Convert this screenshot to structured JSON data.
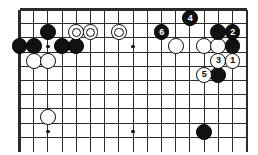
{
  "figure": {
    "kind": "go-board-diagram",
    "board_size": 19,
    "width_px": 258,
    "height_px": 155,
    "background_color": "#ffffff",
    "line_color": "#2b2b2b",
    "black_color": "#111111",
    "white_color": "#ffffff",
    "stone_outline_color": "#0d0d0d"
  },
  "grid": {
    "origin_x": 19.5,
    "origin_y": 9.5,
    "cell": 14.2,
    "cols_visible": 17,
    "rows_visible": 10,
    "edge_top": true,
    "edge_left": true,
    "edge_right": true,
    "edge_bottom": false,
    "border_thickness": 2.2,
    "line_thickness": 1.1
  },
  "star_points": [
    {
      "col": 2,
      "row": 8.6,
      "name": "star-point-left"
    },
    {
      "col": 8,
      "row": 8.6,
      "name": "star-point-center"
    },
    {
      "col": 2,
      "row": 2.6,
      "name": "star-point-upper-left"
    },
    {
      "col": 8,
      "row": 2.6,
      "name": "star-point-upper-center"
    }
  ],
  "stones": [
    {
      "id": "b-a",
      "color": "black",
      "col": 0,
      "row": 2.6,
      "label": "",
      "mark": ""
    },
    {
      "id": "b-b",
      "color": "black",
      "col": 1,
      "row": 2.6,
      "label": "",
      "mark": ""
    },
    {
      "id": "b-c",
      "color": "black",
      "col": 2,
      "row": 1.6,
      "label": "",
      "mark": ""
    },
    {
      "id": "b-d",
      "color": "black",
      "col": 3,
      "row": 2.6,
      "label": "",
      "mark": ""
    },
    {
      "id": "b-e",
      "color": "black",
      "col": 4,
      "row": 2.6,
      "label": "",
      "mark": ""
    },
    {
      "id": "w-a",
      "color": "white",
      "col": 1,
      "row": 3.6,
      "label": "",
      "mark": ""
    },
    {
      "id": "w-b",
      "color": "white",
      "col": 2,
      "row": 3.6,
      "label": "",
      "mark": ""
    },
    {
      "id": "w-c",
      "color": "white",
      "col": 4,
      "row": 1.6,
      "label": "",
      "mark": "circle"
    },
    {
      "id": "w-d",
      "color": "white",
      "col": 5,
      "row": 1.6,
      "label": "",
      "mark": "circle"
    },
    {
      "id": "w-e",
      "color": "white",
      "col": 7,
      "row": 1.6,
      "label": "",
      "mark": "circle"
    },
    {
      "id": "w-f",
      "color": "white",
      "col": 11,
      "row": 2.6,
      "label": "",
      "mark": ""
    },
    {
      "id": "w-g",
      "color": "white",
      "col": 13,
      "row": 2.6,
      "label": "",
      "mark": ""
    },
    {
      "id": "w-h",
      "color": "white",
      "col": 14,
      "row": 2.6,
      "label": "",
      "mark": ""
    },
    {
      "id": "b-f",
      "color": "black",
      "col": 14,
      "row": 1.6,
      "label": "",
      "mark": ""
    },
    {
      "id": "b-g",
      "color": "black",
      "col": 15,
      "row": 2.6,
      "label": "",
      "mark": ""
    },
    {
      "id": "move-1",
      "color": "white",
      "col": 15,
      "row": 3.6,
      "label": "1",
      "mark": ""
    },
    {
      "id": "move-2",
      "color": "black",
      "col": 15,
      "row": 1.6,
      "label": "2",
      "mark": ""
    },
    {
      "id": "move-3",
      "color": "white",
      "col": 14,
      "row": 3.6,
      "label": "3",
      "mark": ""
    },
    {
      "id": "move-4",
      "color": "black",
      "col": 12,
      "row": 0.6,
      "label": "4",
      "mark": ""
    },
    {
      "id": "move-5",
      "color": "white",
      "col": 13,
      "row": 4.6,
      "label": "5",
      "mark": ""
    },
    {
      "id": "move-6",
      "color": "black",
      "col": 10,
      "row": 1.6,
      "label": "6",
      "mark": ""
    },
    {
      "id": "b-h",
      "color": "black",
      "col": 14,
      "row": 4.6,
      "label": "",
      "mark": ""
    },
    {
      "id": "w-i",
      "color": "white",
      "col": 2,
      "row": 7.6,
      "label": "",
      "mark": ""
    },
    {
      "id": "b-i",
      "color": "black",
      "col": 13,
      "row": 8.6,
      "label": "",
      "mark": ""
    }
  ]
}
